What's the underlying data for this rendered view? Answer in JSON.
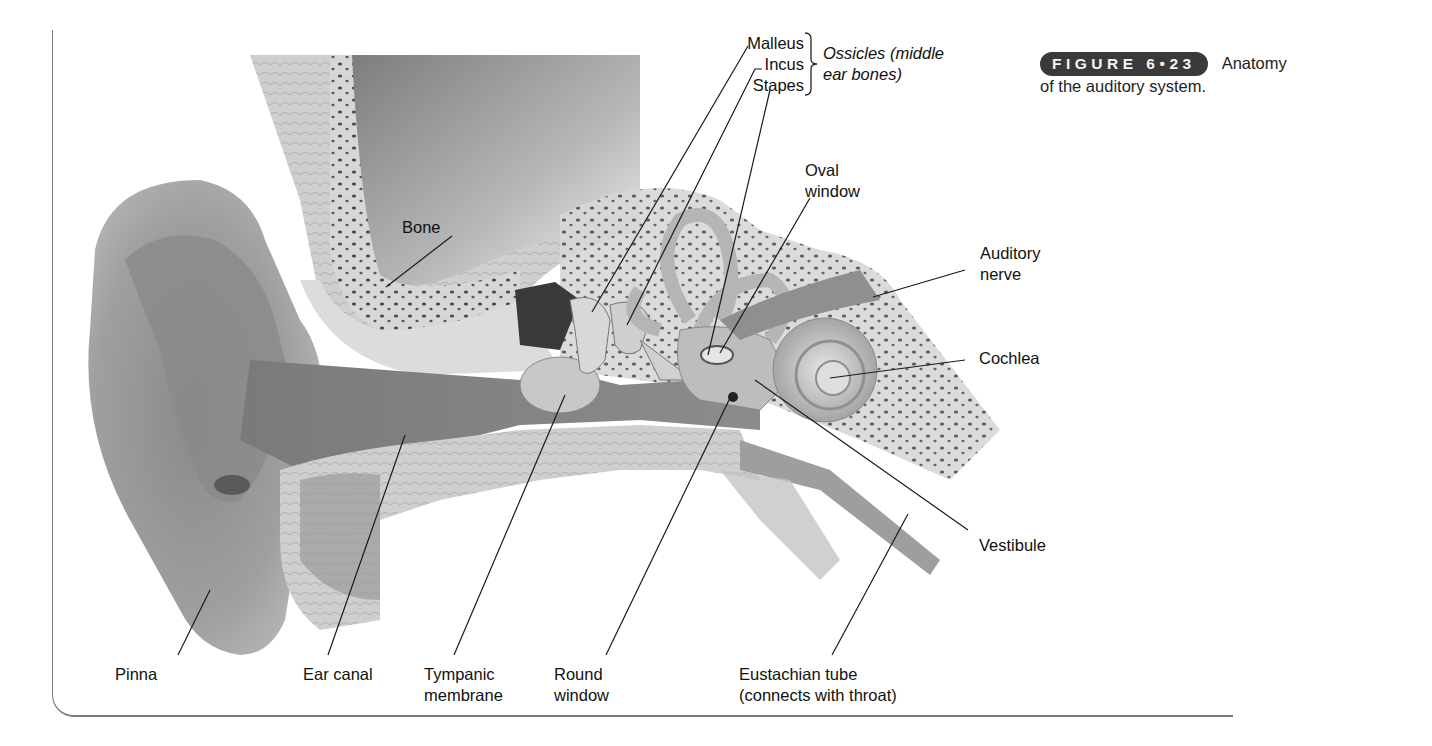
{
  "figure": {
    "badge_label": "FIGURE 6•23",
    "caption_lead": "Anatomy",
    "caption_rest": "of the auditory system."
  },
  "labels": {
    "malleus": "Malleus",
    "incus": "Incus",
    "stapes": "Stapes",
    "ossicles_line1": "Ossicles (middle",
    "ossicles_line2": "ear bones)",
    "oval_window_line1": "Oval",
    "oval_window_line2": "window",
    "bone": "Bone",
    "auditory_nerve_line1": "Auditory",
    "auditory_nerve_line2": "nerve",
    "cochlea": "Cochlea",
    "vestibule": "Vestibule",
    "pinna": "Pinna",
    "ear_canal": "Ear canal",
    "tympanic_line1": "Tympanic",
    "tympanic_line2": "membrane",
    "round_window_line1": "Round",
    "round_window_line2": "window",
    "eustachian_line1": "Eustachian tube",
    "eustachian_line2": "(connects with throat)"
  },
  "colors": {
    "badge_bg": "#3a3a3a",
    "frame": "#7a7a7a",
    "skin": "#a9a9a9",
    "bone": "#d9d9d9",
    "dark_cavity": "#6e6e6e"
  }
}
